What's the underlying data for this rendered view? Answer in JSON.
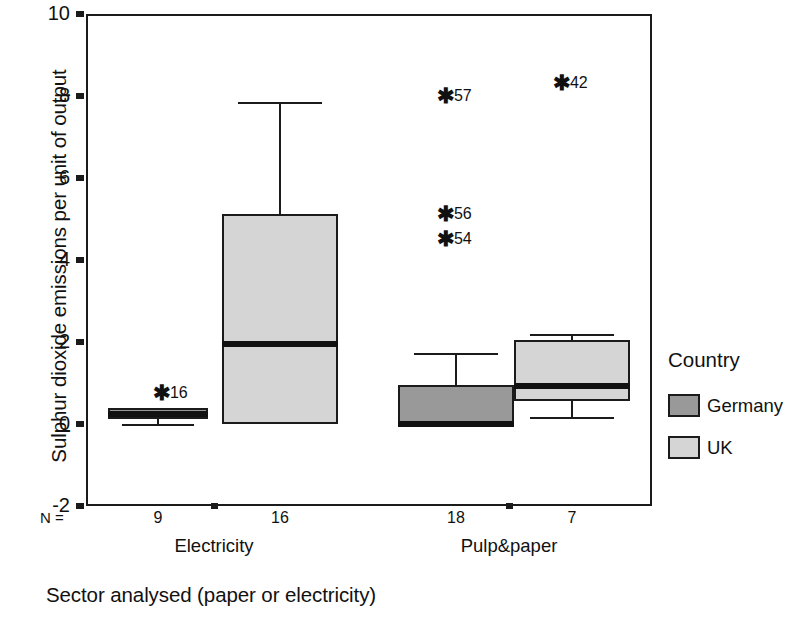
{
  "chart_data": {
    "type": "box",
    "title": "",
    "xlabel": "Sector analysed (paper or electricity)",
    "ylabel": "Sulphur dioxide emissions per unit of output",
    "ylim": [
      -2,
      10
    ],
    "yticks": [
      10,
      8,
      6,
      4,
      2,
      0,
      -2
    ],
    "ytick_labels": [
      "10",
      "8",
      "6",
      "4",
      "2",
      "0",
      "-2"
    ],
    "grid": false,
    "legend": {
      "title": "Country",
      "position": "right",
      "entries": [
        {
          "name": "Germany",
          "color": "#999999"
        },
        {
          "name": "UK",
          "color": "#d5d5d5"
        }
      ]
    },
    "categories": [
      "Electricity",
      "Pulp&paper"
    ],
    "n_prefix": "N =",
    "n_values": [
      "9",
      "16",
      "18",
      "7"
    ],
    "boxes": [
      {
        "category": "Electricity",
        "series": "Germany",
        "n": "9",
        "q1": 0.12,
        "median": 0.25,
        "q3": 0.38,
        "whisker_low": 0.0,
        "whisker_high": 0.4,
        "outliers": [
          {
            "label": "16",
            "value": 0.73
          }
        ]
      },
      {
        "category": "Electricity",
        "series": "UK",
        "n": "16",
        "q1": 0.0,
        "median": 1.95,
        "q3": 5.12,
        "whisker_low": 0.0,
        "whisker_high": 7.85,
        "outliers": []
      },
      {
        "category": "Pulp&paper",
        "series": "Germany",
        "n": "18",
        "q1": 0.0,
        "median": 0.0,
        "q3": 0.95,
        "whisker_low": 0.0,
        "whisker_high": 1.72,
        "outliers": [
          {
            "label": "57",
            "value": 7.98
          },
          {
            "label": "56",
            "value": 5.1
          },
          {
            "label": "54",
            "value": 4.5
          }
        ]
      },
      {
        "category": "Pulp&paper",
        "series": "UK",
        "n": "7",
        "q1": 0.55,
        "median": 0.93,
        "q3": 2.05,
        "whisker_low": 0.17,
        "whisker_high": 2.2,
        "outliers": [
          {
            "label": "42",
            "value": 8.3
          }
        ]
      }
    ]
  },
  "axis": {
    "y_title": "Sulphur dioxide emissions per unit of output",
    "x_title": "Sector analysed (paper or electricity)"
  },
  "legend": {
    "title": "Country",
    "germany_label": "Germany",
    "uk_label": "UK"
  }
}
